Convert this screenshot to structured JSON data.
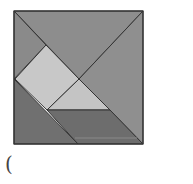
{
  "diagram": {
    "type": "tangram",
    "pieces": [
      {
        "name": "top-triangle",
        "points": "14,11 143,11 79,79",
        "fill": "#8d8d8d"
      },
      {
        "name": "right-triangle",
        "points": "143,11 143,144 79,79",
        "fill": "#8f8f8f"
      },
      {
        "name": "left-small-triangle",
        "points": "14,11 46,45 14,79",
        "fill": "#8a8a8a"
      },
      {
        "name": "square",
        "points": "46,45 79,79 47,110 15,79",
        "fill": "#c8c8c8"
      },
      {
        "name": "middle-triangle",
        "points": "79,79 110,110 47,110",
        "fill": "#c4c4c4"
      },
      {
        "name": "bottom-left-triangle",
        "points": "14,79 78,144 14,144",
        "fill": "#707070"
      },
      {
        "name": "parallelogram",
        "points": "47,110 110,110 143,144 78,144",
        "fill": "#6d6d6d"
      }
    ],
    "stroke": "#333333"
  },
  "label": "("
}
